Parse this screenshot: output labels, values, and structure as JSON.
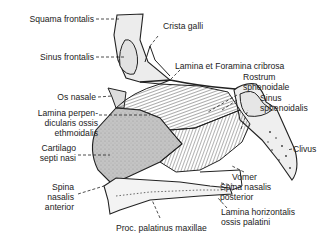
{
  "diagram": {
    "colors": {
      "ink": "#222222",
      "bone_fill": "#e8e8e8",
      "cartilage_fill": "#bdbdbd",
      "hatch": "#555555",
      "background": "#ffffff"
    },
    "labels": {
      "squama_frontalis": "Squama frontalis",
      "crista_galli": "Crista galli",
      "sinus_frontalis": "Sinus frontalis",
      "lamina_cribrosa": "Lamina et Foramina cribrosa",
      "os_nasale": "Os nasale",
      "rostrum_1": "Rostrum",
      "rostrum_2": "sphenoidale",
      "lamina_perp_1": "Lamina perpen-",
      "lamina_perp_2": "dicularis ossis",
      "lamina_perp_3": "ethmoidalis",
      "sinus_sphen_1": "Sinus",
      "sinus_sphen_2": "sphenoidalis",
      "clivus": "Clivus",
      "cartilago_1": "Cartilago",
      "cartilago_2": "septi nasi",
      "vomer": "Vomer",
      "spina_ant_1": "Spina",
      "spina_ant_2": "nasalis",
      "spina_ant_3": "anterior",
      "spina_post_1": "Spina nasalis",
      "spina_post_2": "posterior",
      "lamina_horiz_1": "Lamina horizontalis",
      "lamina_horiz_2": "ossis palatini",
      "proc_palatinus": "Proc. palatinus maxillae"
    }
  }
}
